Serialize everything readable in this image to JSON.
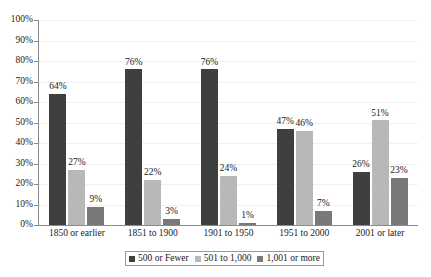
{
  "chart_data": {
    "type": "bar",
    "title": "",
    "subtitle": "",
    "xlabel": "",
    "ylabel": "",
    "ylim": [
      0,
      100
    ],
    "y_unit": "%",
    "grid": true,
    "legend_position": "bottom",
    "y_ticks": [
      "0%",
      "10%",
      "20%",
      "30%",
      "40%",
      "50%",
      "60%",
      "70%",
      "80%",
      "90%",
      "100%"
    ],
    "y_tick_values": [
      0,
      10,
      20,
      30,
      40,
      50,
      60,
      70,
      80,
      90,
      100
    ],
    "categories": [
      "1850 or earlier",
      "1851 to 1900",
      "1901 to 1950",
      "1951 to 2000",
      "2001 or later"
    ],
    "series": [
      {
        "name": "500 or Fewer",
        "color": "#3f3f3f",
        "values": [
          64,
          76,
          76,
          47,
          26
        ],
        "labels": [
          "64%",
          "76%",
          "76%",
          "47%",
          "26%"
        ]
      },
      {
        "name": "501 to 1,000",
        "color": "#b8b8b8",
        "values": [
          27,
          22,
          24,
          46,
          51
        ],
        "labels": [
          "27%",
          "22%",
          "24%",
          "46%",
          "51%"
        ]
      },
      {
        "name": "1,001 or more",
        "color": "#797979",
        "values": [
          9,
          3,
          1,
          7,
          23
        ],
        "labels": [
          "9%",
          "3%",
          "1%",
          "7%",
          "23%"
        ]
      }
    ]
  }
}
